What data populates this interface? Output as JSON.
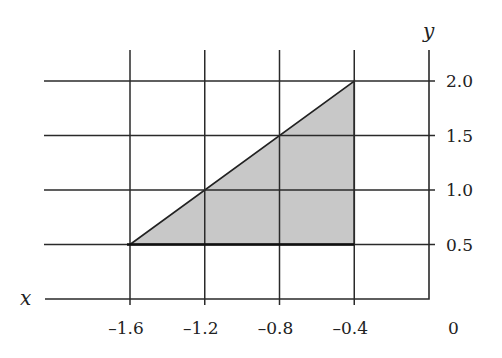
{
  "chart_data": {
    "type": "area",
    "title": "",
    "xlabel": "x",
    "ylabel": "y",
    "xlim": [
      -1.6,
      0
    ],
    "ylim": [
      0,
      2.0
    ],
    "grid": true,
    "x_ticks": [
      -1.6,
      -1.2,
      -0.8,
      -0.4
    ],
    "y_ticks": [
      0.5,
      1.0,
      1.5,
      2.0
    ],
    "x_tick_labels": [
      "–1.6",
      "–1.2",
      "–0.8",
      "–0.4"
    ],
    "y_tick_labels": [
      "0.5",
      "1.0",
      "1.5",
      "2.0"
    ],
    "origin_label": "0",
    "shaded_region": {
      "shape": "triangle",
      "vertices": [
        [
          -1.6,
          0.5
        ],
        [
          -0.4,
          2.0
        ],
        [
          -0.4,
          0.5
        ]
      ],
      "fill": "#c8c8c8",
      "edge": "#222222"
    },
    "legend": null
  },
  "colors": {
    "grid": "#2a2a2a",
    "fill": "#c8c8c8",
    "text": "#222222",
    "background": "#ffffff"
  },
  "layout": {
    "x_px": {
      "-1.6": 130,
      "-1.2": 206,
      "-0.8": 281,
      "-0.4": 355,
      "0": 429
    },
    "y_px": {
      "0": 299,
      "0.5": 244,
      "1.0": 189,
      "1.5": 135,
      "2.0": 81
    }
  }
}
